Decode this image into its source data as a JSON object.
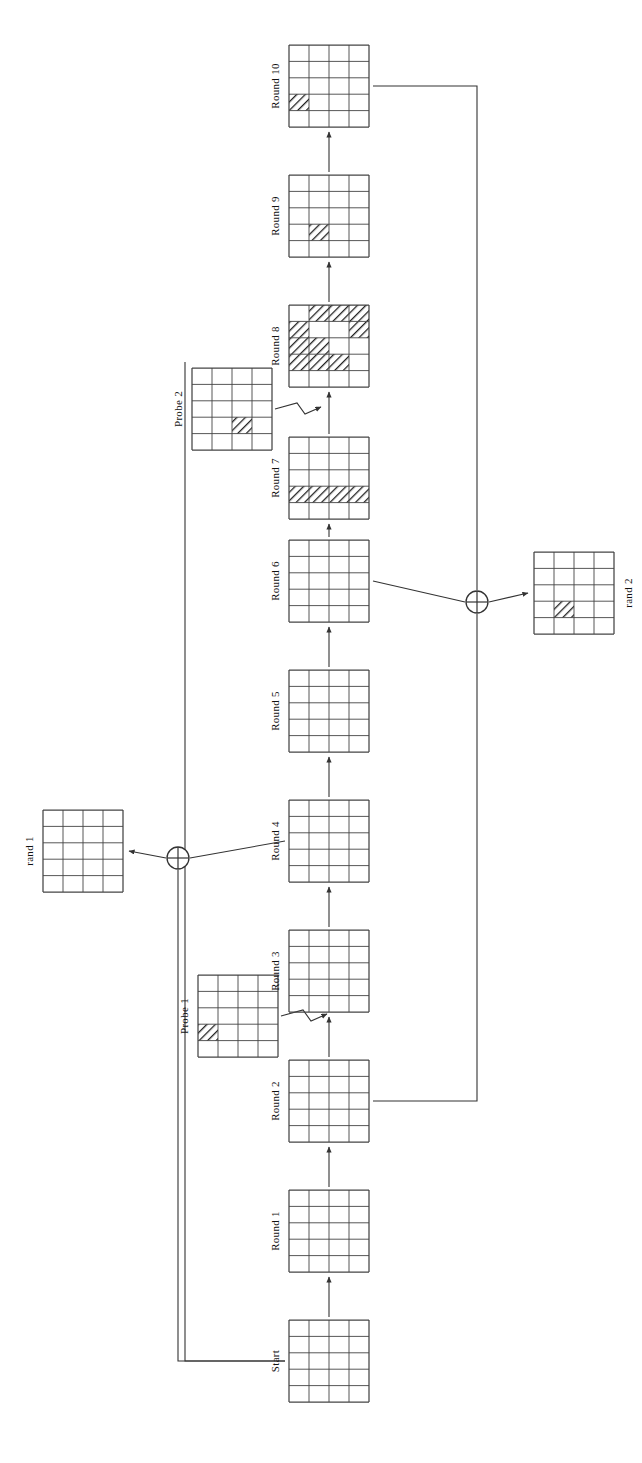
{
  "figure": {
    "orientation_deg": 90,
    "grid": {
      "cols": 4,
      "rows": 5,
      "fill_pattern": "diagonal-hatch"
    },
    "colors": {
      "line": "#333333",
      "grid_stroke": "#444444",
      "hatch": "#222222",
      "background": "#ffffff",
      "text": "#111111"
    }
  },
  "nodes": [
    {
      "id": "start",
      "label": "Start",
      "x": 289,
      "y": 1320,
      "hatched": []
    },
    {
      "id": "round1",
      "label": "Round 1",
      "x": 289,
      "y": 1190,
      "hatched": []
    },
    {
      "id": "round2",
      "label": "Round 2",
      "x": 289,
      "y": 1060,
      "hatched": []
    },
    {
      "id": "probe1",
      "label": "Probe 1",
      "x": 198,
      "y": 975,
      "hatched": [
        [
          4,
          1
        ]
      ]
    },
    {
      "id": "round3",
      "label": "Round 3",
      "x": 289,
      "y": 930,
      "hatched": []
    },
    {
      "id": "round4",
      "label": "Round 4",
      "x": 289,
      "y": 800,
      "hatched": []
    },
    {
      "id": "rand1",
      "label": "rand 1",
      "x": 43,
      "y": 810,
      "hatched": []
    },
    {
      "id": "round5",
      "label": "Round 5",
      "x": 289,
      "y": 670,
      "hatched": []
    },
    {
      "id": "round6",
      "label": "Round 6",
      "x": 289,
      "y": 540,
      "hatched": []
    },
    {
      "id": "rand2",
      "label": "rand 2",
      "x": 534,
      "y": 552,
      "hatched": [
        [
          4,
          2
        ]
      ]
    },
    {
      "id": "round7",
      "label": "Round 7",
      "x": 289,
      "y": 437,
      "hatched": [
        [
          4,
          1
        ],
        [
          4,
          2
        ],
        [
          4,
          3
        ],
        [
          4,
          4
        ]
      ]
    },
    {
      "id": "probe2",
      "label": "Probe 2",
      "x": 192,
      "y": 368,
      "hatched": [
        [
          4,
          3
        ]
      ]
    },
    {
      "id": "round8",
      "label": "Round 8",
      "x": 289,
      "y": 305,
      "hatched": [
        [
          1,
          2
        ],
        [
          1,
          3
        ],
        [
          1,
          4
        ],
        [
          2,
          1
        ],
        [
          2,
          4
        ],
        [
          3,
          1
        ],
        [
          3,
          2
        ],
        [
          4,
          1
        ],
        [
          4,
          2
        ],
        [
          4,
          3
        ]
      ]
    },
    {
      "id": "round9",
      "label": "Round 9",
      "x": 289,
      "y": 175,
      "hatched": [
        [
          4,
          2
        ]
      ]
    },
    {
      "id": "round10",
      "label": "Round 10",
      "x": 289,
      "y": 45,
      "hatched": [
        [
          4,
          1
        ]
      ]
    }
  ],
  "operators": [
    {
      "id": "xor1",
      "symbol": "xor-circle",
      "cx": 178,
      "cy": 858,
      "label": "⊕"
    },
    {
      "id": "xor2",
      "symbol": "xor-circle",
      "cx": 477,
      "cy": 602,
      "label": "⊕"
    }
  ],
  "edges": [
    {
      "id": "e-start-r1",
      "from": "start",
      "to": "round1",
      "kind": "arrow-up"
    },
    {
      "id": "e-r1-r2",
      "from": "round1",
      "to": "round2",
      "kind": "arrow-up"
    },
    {
      "id": "e-r2-r3",
      "from": "round2",
      "to": "round3",
      "kind": "arrow-up"
    },
    {
      "id": "e-probe1-r2r3",
      "from": "probe1",
      "to": "e-r2-r3",
      "kind": "injection-arrow"
    },
    {
      "id": "e-r3-r4",
      "from": "round3",
      "to": "round4",
      "kind": "arrow-up"
    },
    {
      "id": "e-r4-r5",
      "from": "round4",
      "to": "round5",
      "kind": "arrow-up"
    },
    {
      "id": "e-r4-xor1",
      "from": "round4",
      "to": "xor1",
      "kind": "line"
    },
    {
      "id": "e-xor1-rand1",
      "from": "xor1",
      "to": "rand1",
      "kind": "arrow-left"
    },
    {
      "id": "e-start-xor1",
      "from": "start",
      "to": "xor1",
      "kind": "feedback-line"
    },
    {
      "id": "e-r5-r6",
      "from": "round5",
      "to": "round6",
      "kind": "arrow-up"
    },
    {
      "id": "e-r6-r7",
      "from": "round6",
      "to": "round7",
      "kind": "arrow-up"
    },
    {
      "id": "e-r6-xor2",
      "from": "round6",
      "to": "xor2",
      "kind": "line"
    },
    {
      "id": "e-xor2-rand2",
      "from": "xor2",
      "to": "rand2",
      "kind": "arrow-right"
    },
    {
      "id": "e-r2-xor2",
      "from": "round2",
      "to": "xor2",
      "kind": "feedback-line"
    },
    {
      "id": "e-r7-r8",
      "from": "round7",
      "to": "round8",
      "kind": "arrow-up"
    },
    {
      "id": "e-probe2-r7r8",
      "from": "probe2",
      "to": "e-r7-r8",
      "kind": "injection-arrow"
    },
    {
      "id": "e-r8-r9",
      "from": "round8",
      "to": "round9",
      "kind": "arrow-up"
    },
    {
      "id": "e-r9-r10",
      "from": "round9",
      "to": "round10",
      "kind": "arrow-up"
    },
    {
      "id": "e-r10-xor2",
      "from": "round10",
      "to": "xor2",
      "kind": "feedback-line"
    },
    {
      "id": "e-probe2-tap",
      "from": "probe2",
      "to": "start",
      "kind": "bus-line"
    }
  ]
}
